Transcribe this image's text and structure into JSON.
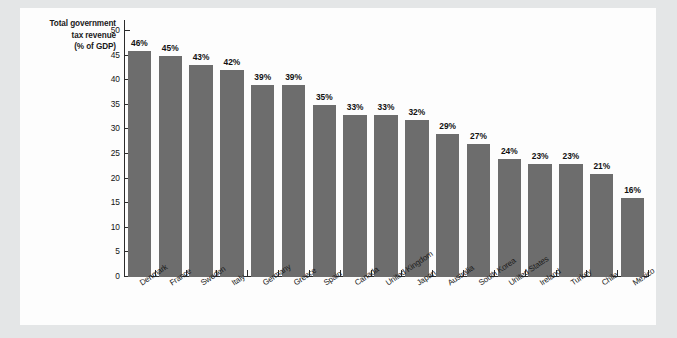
{
  "figure": {
    "panel_background": "#fdfdfd",
    "mat_background": "#e4e6e7",
    "bar_color": "#6d6d6d",
    "axis_color": "#2b2b2b"
  },
  "axis_title": {
    "line1": "Total government",
    "line2": "tax revenue",
    "line3": "(% of GDP)"
  },
  "chart_data": {
    "type": "bar",
    "title": "Total government tax revenue (% of GDP)",
    "xlabel": "",
    "ylabel": "Total government tax revenue (% of GDP)",
    "ylim": [
      0,
      50
    ],
    "yticks": [
      0,
      5,
      10,
      15,
      20,
      25,
      30,
      35,
      40,
      45,
      50
    ],
    "ytick_labels": [
      "0",
      "5",
      "10",
      "15",
      "20",
      "25",
      "30",
      "35",
      "40",
      "45",
      "50"
    ],
    "grid": false,
    "legend": false,
    "categories": [
      "Denmark",
      "France",
      "Sweden",
      "Italy",
      "Germany",
      "Greece",
      "Spain",
      "Canada",
      "United Kingdom",
      "Japan",
      "Australia",
      "South Korea",
      "United States",
      "Ireland",
      "Turkey",
      "Chile",
      "Mexico"
    ],
    "values": [
      46,
      45,
      43,
      42,
      39,
      39,
      35,
      33,
      33,
      32,
      29,
      27,
      24,
      23,
      23,
      21,
      16
    ],
    "data_labels": [
      "46%",
      "45%",
      "43%",
      "42%",
      "39%",
      "39%",
      "35%",
      "33%",
      "33%",
      "32%",
      "29%",
      "27%",
      "24%",
      "23%",
      "23%",
      "21%",
      "16%"
    ]
  }
}
